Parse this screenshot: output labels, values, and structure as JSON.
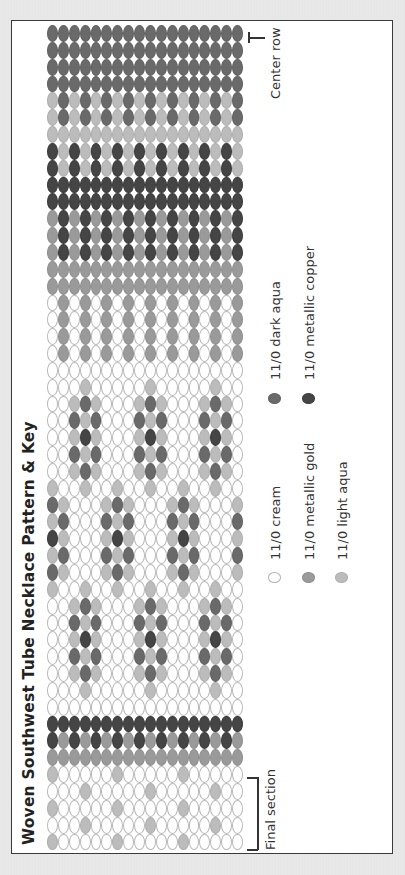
{
  "title": "Woven Southwest Tube Necklace Pattern & Key",
  "annotations": {
    "center_row": "Center row",
    "final_section": "Final section"
  },
  "legend": [
    {
      "code": "C",
      "label": "11/0 cream",
      "color": "#ffffff"
    },
    {
      "code": "G",
      "label": "11/0 metallic gold",
      "color": "#9a9a9a"
    },
    {
      "code": "L",
      "label": "11/0 light aqua",
      "color": "#bcbcbc"
    },
    {
      "code": "D",
      "label": "11/0 dark aqua",
      "color": "#6a6a6a"
    },
    {
      "code": "K",
      "label": "11/0 metallic copper",
      "color": "#454545"
    }
  ],
  "pattern": {
    "columns": 18,
    "rows": [
      "DDDDDDDDDDDDDDDDDD",
      "DDDDDDDDDDDDDDDDDD",
      "DDDDDDDDDDDDDDDDDD",
      "DDDDDDDDDDDDDDDDDD",
      "LDLDLDLDLDLDLDLDLD",
      "LDLDLDLDLDLDLDLDLD",
      "LLLLLLLLLLLLLLLLLL",
      "KLKLKLKLKLKLKLKLKL",
      "KLKLKLKLKLKLKLKLKL",
      "KKKKKKKKKKKKKKKKKK",
      "KKKKKKKKKKKKKKKKKK",
      "GKGKGKGKGKGKGKGKGK",
      "GKGKGKGKGKGKGKGKGK",
      "GKGKGKGKGKGKGKGKGK",
      "GGGGGGGGGGGGGGGGGG",
      "GGGGGGGGGGGGGGGGGG",
      "CGCGCGCGCGCGCGCGCG",
      "CGCGCGCGCGCGCGCGCG",
      "CGCGCGCGCGCGCGCGCG",
      "CGCGCGCGCGCGCGCGCG",
      "CCCCCCCCCCCCCCCCCC",
      "CCCLCCCCCLCCCCCLCC",
      "CCLDLCCCLDLCCCLDLC",
      "CCDLDCCCDLDCCCDLDC",
      "CCLKLCCCLKLCCCLKLC",
      "CCDLDCCCDLDCCCDLDC",
      "CCLDLCCCLDLCCCLDLC",
      "LCCLCCLCCLCCLCCLCC",
      "DLCCCLDLCCCLDLCCCL",
      "LDCCCDLDCCCDLDCCCD",
      "KLCCCLKLCCCLKLCCCL",
      "LDCCCDLDCCCDLDCCCD",
      "DLCCCLDLCCCLDLCCCL",
      "LCCLCCLCCLCCLCCLCC",
      "CCLDLCCCLDLCCCLDLC",
      "CCDLDCCCDLDCCCDLDC",
      "CCLKLCCCLKLCCCLKLC",
      "CCDLDCCCDLDCCCDLDC",
      "CCLDLCCCLDLCCCLDLC",
      "CCCLCCCCCLCCCCCLCC",
      "CCCCCCCCCCCCCCCCCC",
      "KKKKKKKKKKKKKKKKKK",
      "KGKGKGKGKGKGKGKGKG",
      "GGGGGGGGGGGGGGGGGG",
      "LCCCCCLCCCCCLCCCCC",
      "CCCLCCCCCLCCCCCLCC",
      "LCCCCCLCCCCCLCCCCC",
      "CCCLCCCCCLCCCCCLCC",
      "LCCCCCLCCCCCLCCCCC"
    ]
  }
}
